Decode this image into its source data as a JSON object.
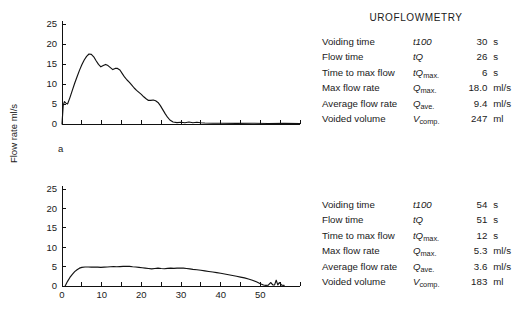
{
  "report": {
    "title": "UROFLOWMETRY",
    "columns": [
      "parameter",
      "symbol",
      "value",
      "unit"
    ],
    "panels": [
      {
        "id": "a",
        "rows": [
          {
            "label": "Voiding time",
            "symbol_main": "t",
            "symbol_rest": "100",
            "symbol_sub": "",
            "value": "30",
            "unit": "s"
          },
          {
            "label": "Flow time",
            "symbol_main": "tQ",
            "symbol_rest": "",
            "symbol_sub": "",
            "value": "26",
            "unit": "s"
          },
          {
            "label": "Time to max flow",
            "symbol_main": "tQ",
            "symbol_rest": "",
            "symbol_sub": "max.",
            "value": "6",
            "unit": "s"
          },
          {
            "label": "Max flow rate",
            "symbol_main": "Q",
            "symbol_rest": "",
            "symbol_sub": "max.",
            "value": "18.0",
            "unit": "ml/s"
          },
          {
            "label": "Average flow rate",
            "symbol_main": "Q",
            "symbol_rest": "",
            "symbol_sub": "ave.",
            "value": "9.4",
            "unit": "ml/s"
          },
          {
            "label": "Voided volume",
            "symbol_main": "V",
            "symbol_rest": "",
            "symbol_sub": "comp.",
            "value": "247",
            "unit": "ml"
          }
        ]
      },
      {
        "id": "b",
        "rows": [
          {
            "label": "Voiding time",
            "symbol_main": "t",
            "symbol_rest": "100",
            "symbol_sub": "",
            "value": "54",
            "unit": "s"
          },
          {
            "label": "Flow time",
            "symbol_main": "tQ",
            "symbol_rest": "",
            "symbol_sub": "",
            "value": "51",
            "unit": "s"
          },
          {
            "label": "Time to max flow",
            "symbol_main": "tQ",
            "symbol_rest": "",
            "symbol_sub": "max.",
            "value": "12",
            "unit": "s"
          },
          {
            "label": "Max flow rate",
            "symbol_main": "Q",
            "symbol_rest": "",
            "symbol_sub": "max.",
            "value": "5.3",
            "unit": "ml/s"
          },
          {
            "label": "Average flow rate",
            "symbol_main": "Q",
            "symbol_rest": "",
            "symbol_sub": "ave.",
            "value": "3.6",
            "unit": "ml/s"
          },
          {
            "label": "Voided volume",
            "symbol_main": "V",
            "symbol_rest": "",
            "symbol_sub": "comp.",
            "value": "183",
            "unit": "ml"
          }
        ]
      }
    ]
  },
  "labels": {
    "panel_a_letter": "a",
    "panel_b_letter": "b",
    "y_axis_title": "Flow rate ml/s",
    "x_unit": "s"
  },
  "chart_data": [
    {
      "type": "line",
      "id": "a",
      "title": "",
      "xlabel": "",
      "ylabel": "Flow rate ml/s",
      "xlim": [
        0,
        60
      ],
      "ylim": [
        0,
        25
      ],
      "yticks": [
        0,
        5,
        10,
        15,
        20,
        25
      ],
      "ytick_labels": [
        "0",
        "5",
        "10",
        "15",
        "20",
        "25"
      ],
      "xticks": [
        0,
        5,
        10,
        15,
        20,
        25,
        30,
        35,
        40,
        45,
        50,
        55,
        60
      ],
      "xtick_labels": [],
      "grid": false,
      "legend": false,
      "x": [
        0.0,
        0.3,
        0.6,
        1.0,
        1.4,
        2.0,
        2.6,
        3.2,
        3.8,
        4.4,
        5.0,
        5.6,
        6.2,
        6.8,
        7.4,
        8.0,
        8.6,
        9.2,
        9.8,
        10.4,
        11.0,
        11.6,
        12.2,
        12.8,
        13.4,
        14.0,
        14.6,
        15.2,
        15.8,
        16.4,
        17.0,
        17.6,
        18.2,
        18.8,
        19.4,
        20.0,
        20.6,
        21.2,
        21.8,
        22.4,
        23.0,
        23.6,
        24.2,
        24.8,
        25.4,
        26.0,
        26.6,
        27.2,
        28.0,
        29.0,
        30.0,
        31.0,
        32.0,
        33.0,
        34.0,
        35.0,
        36.0,
        38.0,
        40.0,
        44.0,
        48.0,
        52.0,
        56.0,
        60.0
      ],
      "y": [
        0.0,
        4.6,
        5.6,
        5.2,
        5.0,
        6.6,
        8.4,
        10.2,
        11.8,
        13.4,
        14.8,
        16.0,
        16.9,
        17.5,
        17.4,
        16.8,
        15.8,
        14.9,
        14.3,
        14.6,
        14.9,
        14.6,
        14.1,
        13.6,
        13.9,
        13.9,
        13.5,
        12.6,
        11.7,
        11.0,
        10.4,
        9.7,
        9.0,
        8.4,
        7.9,
        7.4,
        6.8,
        6.3,
        5.9,
        5.9,
        6.0,
        5.8,
        5.4,
        4.6,
        3.6,
        2.6,
        1.7,
        1.0,
        0.5,
        0.35,
        0.45,
        0.3,
        0.5,
        0.3,
        0.45,
        0.3,
        0.25,
        0.2,
        0.2,
        0.15,
        0.2,
        0.12,
        0.15,
        0.1
      ],
      "max_flow_rate": 18.0,
      "average_flow_rate": 9.4,
      "voiding_time": 30,
      "flow_time": 26,
      "time_to_max_flow": 6,
      "voided_volume": 247
    },
    {
      "type": "line",
      "id": "b",
      "title": "",
      "xlabel": "s",
      "ylabel": "Flow rate ml/s",
      "xlim": [
        0,
        60
      ],
      "ylim": [
        0,
        25
      ],
      "yticks": [
        0,
        5,
        10,
        15,
        20,
        25
      ],
      "ytick_labels": [
        "0",
        "5",
        "10",
        "15",
        "20",
        "25"
      ],
      "xticks": [
        0,
        5,
        10,
        15,
        20,
        25,
        30,
        35,
        40,
        45,
        50,
        55,
        60
      ],
      "xtick_labels": [
        "0",
        "10",
        "20",
        "30",
        "40",
        "50"
      ],
      "xtick_label_values": [
        0,
        10,
        20,
        30,
        40,
        50
      ],
      "grid": false,
      "legend": false,
      "x": [
        0.8,
        1.4,
        2.0,
        2.6,
        3.2,
        3.8,
        4.4,
        5.0,
        5.8,
        6.6,
        7.4,
        8.2,
        9.0,
        9.8,
        10.6,
        11.4,
        12.2,
        13.0,
        13.8,
        14.6,
        15.4,
        16.2,
        17.0,
        17.8,
        18.6,
        19.4,
        20.2,
        21.0,
        21.8,
        22.6,
        23.4,
        24.2,
        25.0,
        25.8,
        26.6,
        27.4,
        28.2,
        29.0,
        29.8,
        30.6,
        31.4,
        32.2,
        33.0,
        34.0,
        35.0,
        36.0,
        37.0,
        38.0,
        39.0,
        40.0,
        41.0,
        42.0,
        43.0,
        44.0,
        45.0,
        46.0,
        47.0,
        48.0,
        49.0,
        50.0,
        50.8,
        51.4,
        52.0,
        52.6,
        53.2,
        53.6,
        54.0,
        54.4,
        54.8,
        55.4,
        56.0
      ],
      "y": [
        0.0,
        1.2,
        2.2,
        3.0,
        3.7,
        4.2,
        4.6,
        4.8,
        4.9,
        4.9,
        4.85,
        4.9,
        4.85,
        4.8,
        4.85,
        4.9,
        4.95,
        5.0,
        4.95,
        5.0,
        5.05,
        5.1,
        5.05,
        4.95,
        4.9,
        4.8,
        4.7,
        4.6,
        4.5,
        4.4,
        4.5,
        4.6,
        4.5,
        4.45,
        4.55,
        4.6,
        4.55,
        4.6,
        4.65,
        4.6,
        4.5,
        4.4,
        4.3,
        4.2,
        4.05,
        3.9,
        3.75,
        3.6,
        3.45,
        3.3,
        3.1,
        2.9,
        2.7,
        2.5,
        2.3,
        2.1,
        1.8,
        1.5,
        1.1,
        0.6,
        0.25,
        0.15,
        0.2,
        0.9,
        0.25,
        0.3,
        1.5,
        0.3,
        0.9,
        0.2,
        0.15
      ],
      "max_flow_rate": 5.3,
      "average_flow_rate": 3.6,
      "voiding_time": 54,
      "flow_time": 51,
      "time_to_max_flow": 12,
      "voided_volume": 183
    }
  ]
}
